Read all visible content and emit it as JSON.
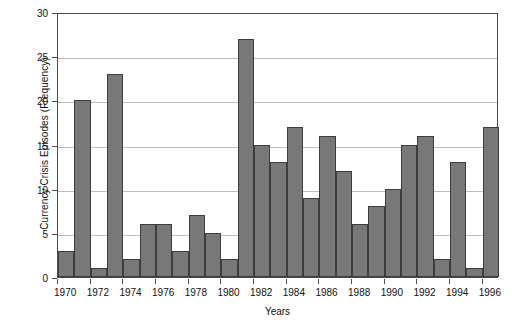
{
  "chart_data": {
    "type": "bar",
    "title": "",
    "xlabel": "Years",
    "ylabel": "Currency Crisis Episodes (Frequency)",
    "categories": [
      "1970",
      "1971",
      "1972",
      "1973",
      "1974",
      "1975",
      "1976",
      "1977",
      "1978",
      "1979",
      "1980",
      "1981",
      "1982",
      "1983",
      "1984",
      "1985",
      "1986",
      "1987",
      "1988",
      "1989",
      "1990",
      "1991",
      "1992",
      "1993",
      "1994",
      "1995",
      "1996"
    ],
    "values": [
      3,
      20,
      1,
      23,
      2,
      6,
      6,
      3,
      7,
      5,
      2,
      27,
      15,
      13,
      17,
      9,
      16,
      12,
      6,
      8,
      10,
      15,
      16,
      2,
      13,
      1,
      17
    ],
    "ylim": [
      0,
      30
    ],
    "ytick_values": [
      0,
      5,
      10,
      15,
      20,
      25,
      30
    ],
    "ytick_labels": [
      "0",
      "5",
      "10",
      "15",
      "20",
      "25",
      "30"
    ],
    "xtick_labels": [
      "1970",
      "1972",
      "1974",
      "1976",
      "1978",
      "1980",
      "1982",
      "1984",
      "1986",
      "1988",
      "1990",
      "1992",
      "1994",
      "1996"
    ],
    "grid": "horizontal",
    "legend": "none",
    "bar_color": "#787878",
    "bar_edge_color": "#3d3d3d",
    "grid_color": "#bdbdbd",
    "axis_color": "#4a4a4a"
  }
}
